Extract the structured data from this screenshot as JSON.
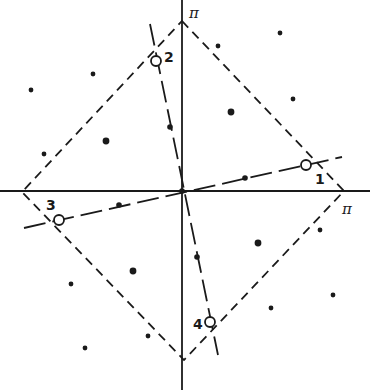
{
  "diagram": {
    "axis_labels": {
      "top": "π",
      "right": "π"
    },
    "colors": {
      "ink": "#1a1a1a",
      "background": "#ffffff"
    },
    "axes": {
      "origin": [
        182,
        191
      ],
      "horizontal": {
        "x1": 0,
        "x2": 370,
        "y": 191
      },
      "vertical": {
        "x": 182,
        "y1": 0,
        "y2": 390
      }
    },
    "zone_boundary": {
      "style": "dashed",
      "vertices": [
        [
          182,
          21
        ],
        [
          344,
          191
        ],
        [
          184,
          360
        ],
        [
          22,
          192
        ]
      ]
    },
    "lines": [
      {
        "id": "line-1-3",
        "style": "long-dash",
        "x1": 24,
        "y1": 228,
        "x2": 342,
        "y2": 157
      },
      {
        "id": "line-2-4",
        "style": "long-dash",
        "x1": 150,
        "y1": 24,
        "x2": 218,
        "y2": 355
      }
    ],
    "numbered_points": [
      {
        "label": "1",
        "circle": [
          306,
          165
        ],
        "label_pos": [
          315,
          184
        ]
      },
      {
        "label": "2",
        "circle": [
          156,
          61
        ],
        "label_pos": [
          164,
          62
        ]
      },
      {
        "label": "3",
        "circle": [
          59,
          220
        ],
        "label_pos": [
          46,
          210
        ]
      },
      {
        "label": "4",
        "circle": [
          210,
          322
        ],
        "label_pos": [
          193,
          329
        ]
      }
    ],
    "line_dots": [
      [
        170,
        127
      ],
      [
        245,
        178
      ],
      [
        119,
        205
      ],
      [
        197,
        257
      ],
      [
        182,
        191
      ]
    ],
    "lattice_dots": [
      [
        31,
        90
      ],
      [
        93,
        74
      ],
      [
        106,
        141
      ],
      [
        44,
        154
      ],
      [
        218,
        46
      ],
      [
        280,
        33
      ],
      [
        293,
        99
      ],
      [
        231,
        112
      ],
      [
        133,
        271
      ],
      [
        71,
        284
      ],
      [
        85,
        348
      ],
      [
        148,
        336
      ],
      [
        258,
        243
      ],
      [
        320,
        230
      ],
      [
        333,
        295
      ],
      [
        271,
        308
      ]
    ],
    "large_dots": [
      [
        106,
        141
      ],
      [
        231,
        112
      ],
      [
        133,
        271
      ],
      [
        258,
        243
      ]
    ]
  }
}
